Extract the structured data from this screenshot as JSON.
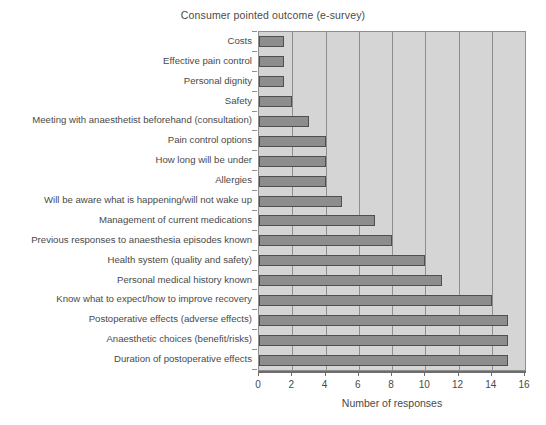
{
  "chart_data": {
    "type": "bar",
    "orientation": "horizontal",
    "title": "Consumer pointed outcome (e-survey)",
    "xlabel": "Number of responses",
    "ylabel": "",
    "xlim": [
      0,
      16
    ],
    "xticks": [
      0,
      2,
      4,
      6,
      8,
      10,
      12,
      14,
      16
    ],
    "grid": "vertical",
    "legend": "none",
    "bar_color": "#8d8d8d",
    "bar_edge_color": "#4f4f4f",
    "plot_background": "#d5d5d5",
    "gridline_color": "#8e8e8e",
    "categories": [
      "Costs",
      "Effective pain control",
      "Personal dignity",
      "Safety",
      "Meeting with anaesthetist beforehand (consultation)",
      "Pain control options",
      "How long will be under",
      "Allergies",
      "Will be aware what is happening/will not wake up",
      "Management of current medications",
      "Previous responses to anaesthesia episodes known",
      "Health system (quality and safety)",
      "Personal medical history known",
      "Know what to expect/how to improve recovery",
      "Postoperative effects (adverse effects)",
      "Anaesthetic choices (benefit/risks)",
      "Duration of postoperative effects"
    ],
    "values": [
      1.5,
      1.5,
      1.5,
      2,
      3,
      4,
      4,
      4,
      5,
      7,
      8,
      10,
      11,
      14,
      15,
      15,
      15
    ]
  }
}
